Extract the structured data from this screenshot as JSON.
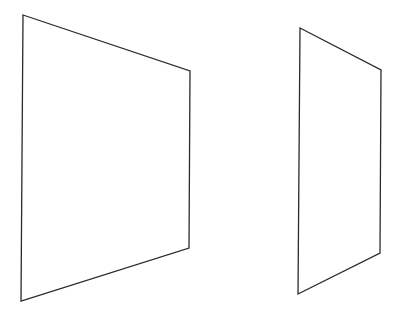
{
  "canvas": {
    "width": 399,
    "height": 312,
    "background": "#ffffff"
  },
  "stroke": {
    "color": "#2a2a2a",
    "width": 1.3
  },
  "shapes": [
    {
      "name": "large-quadrilateral",
      "points": "23,15 190,71 189,248 21,301"
    },
    {
      "name": "small-quadrilateral",
      "points": "300,28 381,70 380,253 298,294"
    }
  ]
}
